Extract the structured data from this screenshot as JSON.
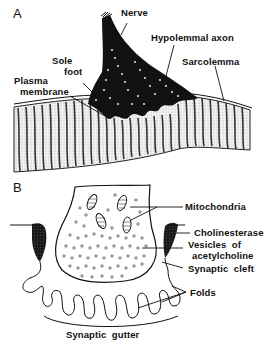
{
  "figure": {
    "panels": [
      {
        "id": "A",
        "letter": "A",
        "description": "Motor end-plate in longitudinal section on a striated muscle fiber",
        "labels": {
          "nerve": "Nerve",
          "hypolemmal_axon": "Hypolemmal axon",
          "sole_foot_line1": "Sole",
          "sole_foot_line2": "foot",
          "sarcolemma": "Sarcolemma",
          "plasma_membrane_line1": "Plasma",
          "plasma_membrane_line2": "membrane"
        }
      },
      {
        "id": "B",
        "letter": "B",
        "description": "Enlarged view of an axon terminal within the synaptic gutter",
        "labels": {
          "mitochondria": "Mitochondria",
          "cholinesterase": "Cholinesterase",
          "vesicles_line1": "Vesicles  of",
          "vesicles_line2": "acetylcholine",
          "synaptic_cleft": "Synaptic  cleft",
          "folds": "Folds",
          "synaptic_gutter": "Synaptic  gutter"
        }
      }
    ],
    "colors": {
      "ink": "#111111",
      "background": "#ffffff",
      "muscle_stipple": "#d6d6d6"
    }
  }
}
